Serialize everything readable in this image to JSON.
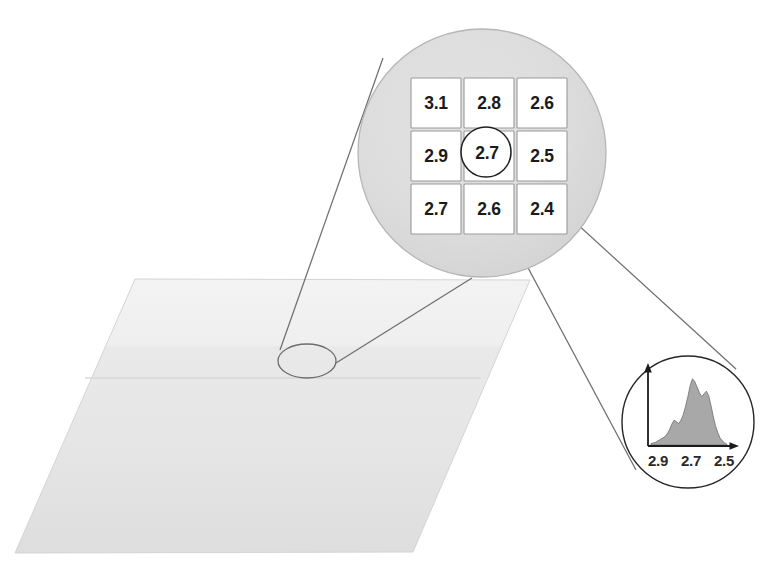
{
  "figure": {
    "background_color": "#ffffff"
  },
  "ground_plane": {
    "name": "surface-plane",
    "fill_top": "#efefef",
    "fill_bottom": "#e3e3e3",
    "stroke": "#d2d2d2",
    "corners": [
      [
        135,
        279
      ],
      [
        530,
        280
      ],
      [
        413,
        552
      ],
      [
        15,
        553
      ]
    ]
  },
  "sample_marker": {
    "name": "sample-ellipse",
    "center": [
      307,
      360
    ],
    "rx": 29,
    "ry": 17,
    "stroke": "#6d6d6d"
  },
  "magnifier": {
    "name": "magnified-neighbourhood",
    "center": [
      482,
      153
    ],
    "radius": 124,
    "fill": "#dcdcdc",
    "stroke": "#b4b4b4",
    "grid": {
      "columns": 3,
      "rows": 3,
      "cell_fill": "#ffffff",
      "cell_stroke": "#9a9a9a",
      "values": [
        [
          "3.1",
          "2.8",
          "2.6"
        ],
        [
          "2.9",
          "2.7",
          "2.5"
        ],
        [
          "2.7",
          "2.6",
          "2.4"
        ]
      ]
    },
    "focus_circle": {
      "name": "focus-pixel-circle",
      "center": [
        485,
        152
      ],
      "radius": 25,
      "stroke": "#1f1f1f",
      "value": "2.7"
    }
  },
  "histogram_bubble": {
    "name": "value-histogram",
    "center": [
      688,
      422
    ],
    "radius": 66,
    "stroke": "#262626",
    "axis_color": "#1a1a1a",
    "fill_color": "#a8a8a8",
    "fill_stroke": "#6f6f6f",
    "tick_labels": [
      "2.9",
      "2.7",
      "2.5"
    ]
  },
  "leaders": {
    "name": "leader-lines",
    "stroke": "#6a6a6a",
    "to_magnifier": [
      [
        [
          279,
          349
        ],
        [
          381,
          60
        ]
      ],
      [
        [
          336,
          364
        ],
        [
          470,
          277
        ]
      ]
    ],
    "to_histogram": [
      [
        [
          480,
          175
        ],
        [
          637,
          468
        ]
      ],
      [
        [
          509,
          163
        ],
        [
          733,
          372
        ]
      ]
    ]
  },
  "chart_data": {
    "type": "bar",
    "xlabel": "",
    "ylabel": "",
    "tick_labels": [
      "2.9",
      "2.7",
      "2.5"
    ],
    "tick_positions": [
      0.22,
      0.5,
      0.78
    ],
    "categories": [
      "0.00",
      "0.03",
      "0.06",
      "0.09",
      "0.12",
      "0.15",
      "0.18",
      "0.21",
      "0.24",
      "0.27",
      "0.30",
      "0.33",
      "0.36",
      "0.39",
      "0.42",
      "0.45",
      "0.48",
      "0.51",
      "0.54",
      "0.57",
      "0.60",
      "0.63",
      "0.66",
      "0.69",
      "0.72",
      "0.75",
      "0.78",
      "0.81",
      "0.84",
      "0.87",
      "0.90",
      "0.93",
      "0.96",
      "1.00"
    ],
    "values": [
      2,
      3,
      4,
      6,
      8,
      10,
      12,
      16,
      22,
      30,
      36,
      34,
      31,
      36,
      44,
      56,
      70,
      86,
      96,
      92,
      84,
      76,
      70,
      74,
      78,
      72,
      58,
      42,
      28,
      18,
      10,
      6,
      3,
      1
    ],
    "ylim": [
      0,
      100
    ],
    "grid": false,
    "legend": "none"
  }
}
